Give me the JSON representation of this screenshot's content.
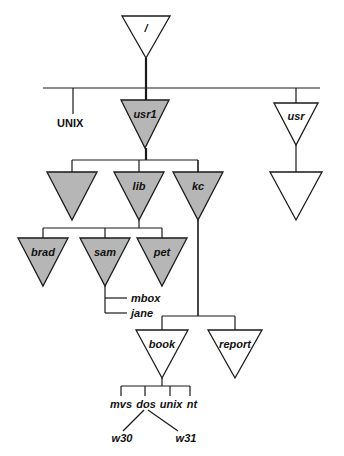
{
  "diagram": {
    "system_label": "UNIX",
    "colors": {
      "filled": "#b6b6b6",
      "empty": "#ffffff",
      "stroke": "#1a1a1a",
      "background": "#ffffff"
    },
    "nodes": {
      "root": {
        "label": "/",
        "filled": false,
        "cx": 146,
        "cy": 16,
        "half": 24,
        "h": 42
      },
      "usr1": {
        "label": "usr1",
        "filled": true,
        "cx": 145,
        "cy": 100,
        "half": 24,
        "h": 48
      },
      "usr": {
        "label": "usr",
        "filled": false,
        "cx": 296,
        "cy": 103,
        "half": 22,
        "h": 42
      },
      "usr_child": {
        "label": "",
        "filled": false,
        "cx": 296,
        "cy": 172,
        "half": 26,
        "h": 48
      },
      "bin": {
        "label": "",
        "filled": true,
        "cx": 72,
        "cy": 172,
        "half": 25,
        "h": 48
      },
      "lib": {
        "label": "lib",
        "filled": true,
        "cx": 139,
        "cy": 172,
        "half": 25,
        "h": 48
      },
      "kc": {
        "label": "kc",
        "filled": true,
        "cx": 198,
        "cy": 172,
        "half": 25,
        "h": 48
      },
      "brad": {
        "label": "brad",
        "filled": true,
        "cx": 43,
        "cy": 238,
        "half": 25,
        "h": 48
      },
      "sam": {
        "label": "sam",
        "filled": true,
        "cx": 105,
        "cy": 238,
        "half": 25,
        "h": 48
      },
      "pet": {
        "label": "pet",
        "filled": true,
        "cx": 162,
        "cy": 238,
        "half": 25,
        "h": 48
      },
      "book": {
        "label": "book",
        "filled": false,
        "cx": 162,
        "cy": 330,
        "half": 26,
        "h": 48
      },
      "report": {
        "label": "report",
        "filled": false,
        "cx": 235,
        "cy": 330,
        "half": 27,
        "h": 48
      }
    },
    "files": {
      "mbox": {
        "label": "mbox",
        "x": 131,
        "y": 301
      },
      "jane": {
        "label": "jane",
        "x": 131,
        "y": 316
      }
    },
    "book_children": [
      {
        "label": "mvs",
        "x": 121,
        "y": 404,
        "tick_x": 121
      },
      {
        "label": "dos",
        "x": 145,
        "y": 404,
        "tick_x": 145
      },
      {
        "label": "unix",
        "x": 170,
        "y": 404,
        "tick_x": 170
      },
      {
        "label": "nt",
        "x": 190,
        "y": 404,
        "tick_x": 190
      }
    ],
    "dos_children": [
      {
        "label": "w30",
        "x": 122,
        "y": 438
      },
      {
        "label": "w31",
        "x": 175,
        "y": 438
      }
    ]
  }
}
